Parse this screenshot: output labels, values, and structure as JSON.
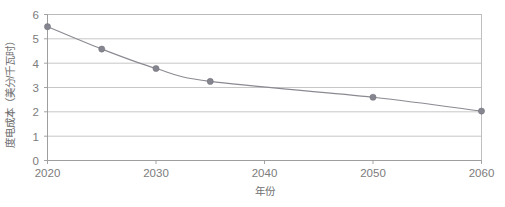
{
  "chart_data": {
    "type": "line",
    "title": "",
    "xlabel": "年份",
    "ylabel": "度电成本（美分/千瓦时）",
    "xlim": [
      2020,
      2060
    ],
    "ylim": [
      0,
      6
    ],
    "grid": true,
    "legend": "none",
    "x": [
      2020,
      2025,
      2030,
      2035,
      2050,
      2060
    ],
    "values": [
      5.5,
      4.58,
      3.78,
      3.25,
      2.6,
      2.03
    ],
    "series": [
      {
        "name": "度电成本",
        "x": [
          2020,
          2025,
          2030,
          2035,
          2050,
          2060
        ],
        "values": [
          5.5,
          4.58,
          3.78,
          3.25,
          2.6,
          2.03
        ]
      }
    ],
    "x_tick_labels": [
      "2020",
      "2030",
      "2040",
      "2050",
      "2060"
    ],
    "x_tick_values": [
      2020,
      2030,
      2040,
      2050,
      2060
    ],
    "y_tick_labels": [
      "0",
      "1",
      "2",
      "3",
      "4",
      "5",
      "6"
    ],
    "y_tick_values": [
      0,
      1,
      2,
      3,
      4,
      5,
      6
    ],
    "colors": {
      "line": "#8a8a92",
      "marker": "#85858f",
      "grid": "#b9b9b9",
      "axis": "#9a9a9a",
      "text": "#7c7c7c",
      "background": "#ffffff"
    }
  },
  "axis": {
    "y_title": "度电成本（美分/千瓦时）",
    "x_title": "年份"
  },
  "y_ticks": [
    {
      "label": "6"
    },
    {
      "label": "5"
    },
    {
      "label": "4"
    },
    {
      "label": "3"
    },
    {
      "label": "2"
    },
    {
      "label": "1"
    },
    {
      "label": "0"
    }
  ],
  "x_ticks": [
    {
      "label": "2020"
    },
    {
      "label": "2030"
    },
    {
      "label": "2040"
    },
    {
      "label": "2050"
    },
    {
      "label": "2060"
    }
  ]
}
